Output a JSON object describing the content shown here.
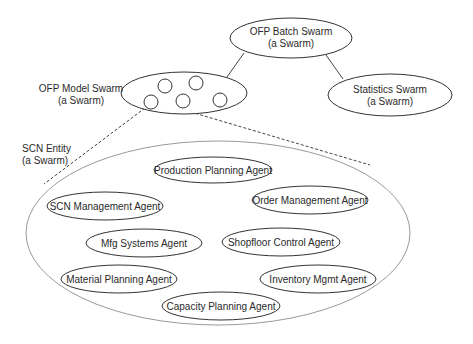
{
  "diagram": {
    "swarms": {
      "ofp_batch": {
        "name": "OFP Batch Swarm",
        "type": "(a Swarm)"
      },
      "ofp_model": {
        "name": "OFP Model Swarm",
        "type": "(a Swarm)"
      },
      "statistics": {
        "name": "Statistics Swarm",
        "type": "(a Swarm)"
      },
      "scn_entity": {
        "name": "SCN Entity",
        "type": "(a Swarm)"
      }
    },
    "agents": [
      {
        "label": "Production Planning Agent"
      },
      {
        "label": "SCN Management Agent"
      },
      {
        "label": "Order Management Agent"
      },
      {
        "label": "Mfg Systems Agent"
      },
      {
        "label": "Shopfloor Control Agent"
      },
      {
        "label": "Material Planning Agent"
      },
      {
        "label": "Inventory Mgmt Agent"
      },
      {
        "label": "Capacity Planning Agent"
      }
    ],
    "model_swarm_member_count": 5,
    "colors": {
      "stroke": "#333333",
      "outer_ellipse": "#9a9a9a",
      "text": "#2a2a2a",
      "background": "#ffffff"
    }
  }
}
